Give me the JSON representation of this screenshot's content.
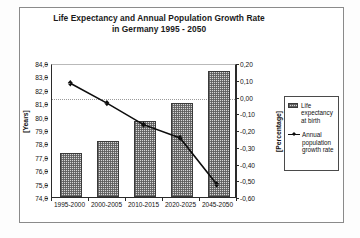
{
  "chart_data": {
    "type": "bar",
    "title": "Life Expectancy and Annual Population Growth Rate in Germany 1995 - 2050",
    "title_line1": "Life Expectancy and Annual Population Growth Rate",
    "title_line2": "in Germany 1995 - 2050",
    "categories": [
      "1995-2000",
      "2000-2005",
      "2010-2015",
      "2020-2025",
      "2045-2050"
    ],
    "xlabel": "",
    "ylabel": "[Years]",
    "ylabel_secondary": "[Percentage]",
    "ylim": [
      74.0,
      84.0
    ],
    "ylim_secondary": [
      -0.6,
      0.2
    ],
    "ytick_labels": [
      "84,0",
      "83,0",
      "82,0",
      "81,0",
      "80,0",
      "79,0",
      "78,0",
      "77,0",
      "76,0",
      "75,0",
      "74,0"
    ],
    "ytick_values": [
      84.0,
      83.0,
      82.0,
      81.0,
      80.0,
      79.0,
      78.0,
      77.0,
      76.0,
      75.0,
      74.0
    ],
    "ytick_labels_secondary": [
      "0,20",
      "0,10",
      "0,00",
      "-0,10",
      "-0,20",
      "-0,30",
      "-0,40",
      "-0,50",
      "-0,60"
    ],
    "ytick_values_secondary": [
      0.2,
      0.1,
      0.0,
      -0.1,
      -0.2,
      -0.3,
      -0.4,
      -0.5,
      -0.6
    ],
    "grid": false,
    "zero_line_secondary": 0.0,
    "legend_position": "right",
    "series": [
      {
        "name": "Life expectancy at birth",
        "legend_label_lines": [
          "Life",
          "expectancy",
          "at birth"
        ],
        "type": "bar",
        "axis": "left",
        "unit": "Years",
        "values": [
          77.3,
          78.2,
          79.65,
          81.0,
          83.4
        ]
      },
      {
        "name": "Annual population growth rate",
        "legend_label_lines": [
          "Annual",
          "population",
          "growth rate"
        ],
        "type": "line",
        "axis": "right",
        "unit": "Percentage",
        "values": [
          0.09,
          -0.03,
          -0.16,
          -0.24,
          -0.52
        ]
      }
    ]
  },
  "legend": {
    "entry_bar_label": "Life expectancy at birth",
    "entry_line_label": "Annual population growth rate"
  }
}
